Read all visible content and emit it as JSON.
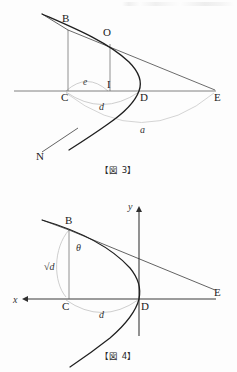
{
  "document": {
    "type": "geometry-figures",
    "language": "ja",
    "background_color": "#fdfdfd",
    "ink_color": "#1b1b1b",
    "arc_color": "#b9b9b9"
  },
  "figure3": {
    "caption": "【図 3】",
    "points": [
      {
        "id": "B",
        "label": "B",
        "x": 66,
        "y": 26
      },
      {
        "id": "O",
        "label": "O",
        "x": 108,
        "y": 40
      },
      {
        "id": "C",
        "label": "C",
        "x": 66,
        "y": 91
      },
      {
        "id": "I",
        "label": "I",
        "x": 108,
        "y": 91
      },
      {
        "id": "D",
        "label": "D",
        "x": 139,
        "y": 91
      },
      {
        "id": "E",
        "label": "E",
        "x": 215,
        "y": 91
      },
      {
        "id": "N",
        "label": "N",
        "x": 40,
        "y": 157
      }
    ],
    "measure_labels": [
      {
        "id": "e",
        "label": "e",
        "x": 86,
        "y": 81
      },
      {
        "id": "d",
        "label": "d",
        "x": 102,
        "y": 104
      },
      {
        "id": "a",
        "label": "a",
        "x": 143,
        "y": 129
      }
    ],
    "arcs": [
      {
        "id": "arc-e",
        "from": "C",
        "to": "I"
      },
      {
        "id": "arc-d",
        "from": "C",
        "to": "D"
      },
      {
        "id": "arc-a",
        "from": "C",
        "to": "E"
      }
    ],
    "segments": [
      {
        "id": "horizontal-axis",
        "from": "left-edge",
        "to": "E"
      },
      {
        "id": "segment-B-C",
        "from": "B",
        "to": "C"
      },
      {
        "id": "segment-O-I",
        "from": "O",
        "to": "I"
      },
      {
        "id": "segment-B-E",
        "from": "B",
        "to": "E"
      },
      {
        "id": "segment-N-B-upper",
        "from": "N",
        "to": "upper-left"
      }
    ],
    "curve": {
      "id": "parabola",
      "vertex": "D",
      "opens": "left"
    }
  },
  "figure4": {
    "caption": "【図 4】",
    "axes": [
      {
        "id": "x-axis",
        "label": "x",
        "direction": "left",
        "label_x": 14,
        "label_y": 100
      },
      {
        "id": "y-axis",
        "label": "y",
        "direction": "up",
        "label_x": 129,
        "label_y": 20
      }
    ],
    "points": [
      {
        "id": "B",
        "label": "B",
        "x": 70,
        "y": 40
      },
      {
        "id": "C",
        "label": "C",
        "x": 66,
        "y": 113
      },
      {
        "id": "D",
        "label": "D",
        "x": 139,
        "y": 113
      },
      {
        "id": "E",
        "label": "E",
        "x": 215,
        "y": 104
      }
    ],
    "measure_labels": [
      {
        "id": "theta",
        "label": "θ",
        "x": 80,
        "y": 60
      },
      {
        "id": "sqrt-d",
        "label": "√d",
        "x": 50,
        "y": 80
      },
      {
        "id": "d",
        "label": "d",
        "x": 102,
        "y": 126
      }
    ],
    "arcs": [
      {
        "id": "arc-sqrt-d",
        "from": "C",
        "to": "B"
      },
      {
        "id": "arc-d",
        "from": "C",
        "to": "D"
      }
    ],
    "segments": [
      {
        "id": "x-axis-line",
        "from": "arrow-left",
        "to": "E"
      },
      {
        "id": "y-axis-line",
        "from": "arrow-up",
        "to": "below"
      },
      {
        "id": "segment-B-C",
        "from": "B",
        "to": "C"
      },
      {
        "id": "segment-B-E",
        "from": "B",
        "to": "E"
      },
      {
        "id": "tangent-line",
        "from": "upper-left",
        "to": "B"
      }
    ],
    "curve": {
      "id": "parabola",
      "vertex": "D",
      "opens": "left"
    }
  }
}
